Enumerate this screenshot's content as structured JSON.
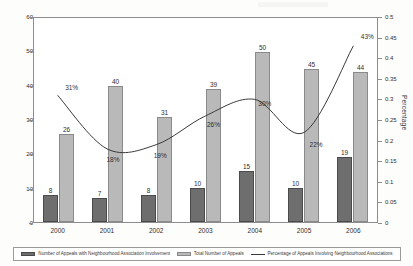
{
  "chart_data": {
    "type": "bar",
    "title": "",
    "subtitle": "",
    "xlabel": "",
    "ylabel": "",
    "y2label": "Percentage",
    "categories": [
      "2000",
      "2001",
      "2002",
      "2003",
      "2004",
      "2005",
      "2006"
    ],
    "ylim": [
      0,
      60
    ],
    "y2lim": [
      0,
      0.5
    ],
    "yticks": [
      "0",
      "10",
      "20",
      "30",
      "40",
      "50",
      "60"
    ],
    "y2ticks": [
      "0",
      "0.05",
      "0.1",
      "0.15",
      "0.2",
      "0.25",
      "0.3",
      "0.35",
      "0.4",
      "0.45",
      "0.5"
    ],
    "grid": false,
    "legend_position": "bottom",
    "series": [
      {
        "name": "Number of Appeals with Neighbourhood Association Involvement",
        "type": "bar",
        "axis": "left",
        "color": "#6e6e6e",
        "values": [
          8,
          7,
          8,
          10,
          15,
          10,
          19
        ],
        "labels": [
          "8",
          "7",
          "8",
          "10",
          "15",
          "10",
          "19"
        ]
      },
      {
        "name": "Total Number of Appeals",
        "type": "bar",
        "axis": "left",
        "color": "#b9b9b9",
        "values": [
          26,
          40,
          31,
          39,
          50,
          45,
          44
        ],
        "labels": [
          "26",
          "40",
          "31",
          "39",
          "50",
          "45",
          "44"
        ]
      },
      {
        "name": "Percentage of Appeals Involving Neighbourhood Associations",
        "type": "line",
        "axis": "right",
        "color": "#3a3a3a",
        "values": [
          0.31,
          0.18,
          0.19,
          0.26,
          0.3,
          0.22,
          0.43
        ],
        "labels": [
          "31%",
          "18%",
          "19%",
          "26%",
          "30%",
          "22%",
          "43%"
        ]
      }
    ]
  },
  "legend": {
    "entries": [
      {
        "label": "Number of Appeals with Neighbourhood Association Involvement",
        "marker": "swatch-dark"
      },
      {
        "label": "Total Number of Appeals",
        "marker": "swatch-light"
      },
      {
        "label": "Percentage of Appeals Involving Neighbourhood Associations",
        "marker": "swatch-line"
      }
    ]
  }
}
